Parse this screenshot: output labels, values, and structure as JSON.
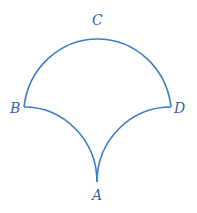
{
  "diagram": {
    "stroke_color": "#3a7cc8",
    "label_color": "#3a5fa8",
    "labels": {
      "A": "A",
      "B": "B",
      "C": "C",
      "D": "D"
    }
  }
}
